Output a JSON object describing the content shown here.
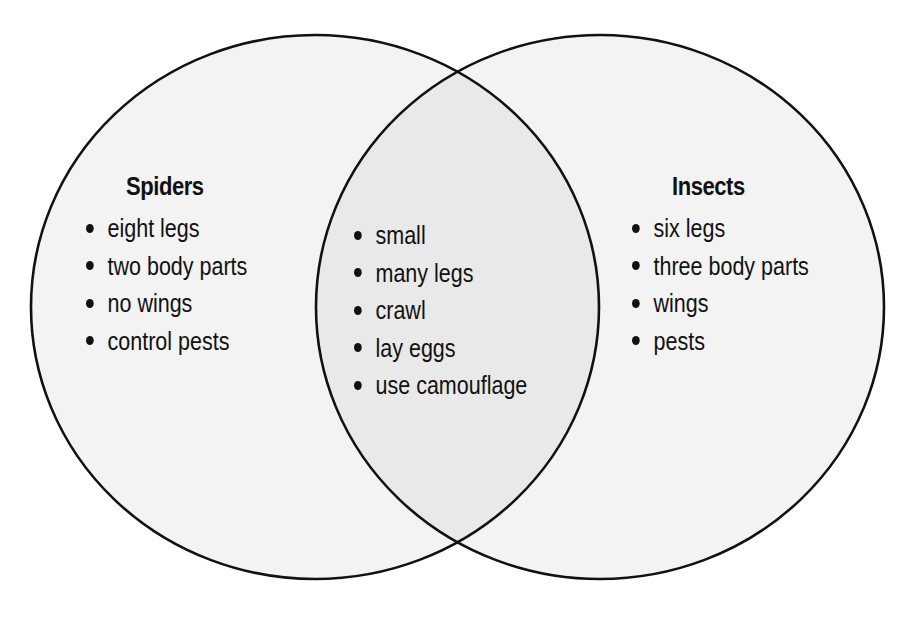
{
  "diagram": {
    "type": "venn",
    "colors": {
      "outline": "#111111",
      "fill_outer": "#f3f3f3",
      "fill_overlap": "#e9e9e9",
      "background": "#ffffff",
      "text": "#111111"
    },
    "sets": [
      {
        "id": "spiders",
        "title": "Spiders",
        "items": [
          "eight legs",
          "two body parts",
          "no wings",
          "control pests"
        ]
      },
      {
        "id": "insects",
        "title": "Insects",
        "items": [
          "six legs",
          "three body parts",
          "wings",
          "pests"
        ]
      }
    ],
    "overlap": {
      "id": "shared",
      "items": [
        "small",
        "many legs",
        "crawl",
        "lay eggs",
        "use camouflage"
      ]
    }
  }
}
